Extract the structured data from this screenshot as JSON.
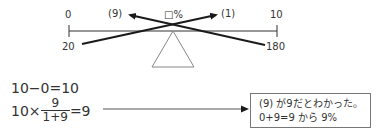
{
  "scale": {
    "top_left": "0",
    "top_right": "10",
    "bottom_left": "20",
    "bottom_right": "180",
    "center_label": "□%",
    "arrow_left_label": "(9)",
    "arrow_right_label": "(1)"
  },
  "equations": {
    "line1": "10−0=10",
    "line2_prefix": "10×",
    "line2_numerator": "9",
    "line2_denominator": "1+9",
    "line2_suffix": "=9"
  },
  "note": {
    "line1": "(9) が9だとわかった。",
    "line2": "0+9=9 から 9%"
  },
  "colors": {
    "line": "#333333",
    "arrow": "#1a1a1a",
    "box_border": "#777777",
    "triangle": "#888888"
  }
}
